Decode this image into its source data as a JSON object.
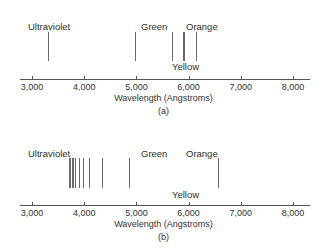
{
  "axis": {
    "min": 3000,
    "max": 8000,
    "ticks": [
      {
        "value": 3000,
        "label": "3,000"
      },
      {
        "value": 4000,
        "label": "4,000"
      },
      {
        "value": 5000,
        "label": "5,000"
      },
      {
        "value": 6000,
        "label": "6,000"
      },
      {
        "value": 7000,
        "label": "7,000"
      },
      {
        "value": 8000,
        "label": "8,000"
      }
    ],
    "xlabel": "Wavelength (Angstroms)"
  },
  "panels": [
    {
      "caption": "(a)",
      "labels": {
        "ultraviolet": "Ultraviolet",
        "green": "Green",
        "orange": "Orange",
        "yellow": "Yellow"
      },
      "lines": [
        3300,
        4970,
        5680,
        5890,
        5920,
        6150
      ]
    },
    {
      "caption": "(b)",
      "labels": {
        "ultraviolet": "Ultraviolet",
        "green": "Green",
        "orange": "Orange",
        "yellow": "Yellow"
      },
      "lines": [
        3700,
        3730,
        3760,
        3790,
        3830,
        3890,
        3970,
        4100,
        4340,
        4860,
        6560
      ]
    }
  ]
}
